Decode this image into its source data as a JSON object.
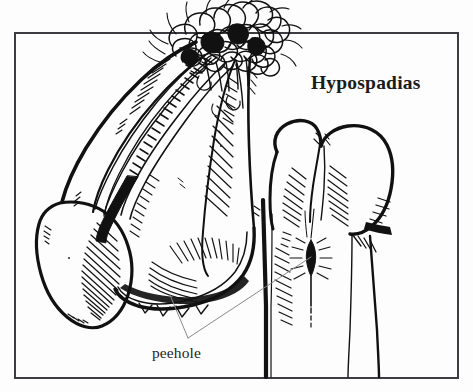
{
  "figure": {
    "domain": "Diagram",
    "kind": "medical-line-illustration",
    "medium": "pen-and-ink black and white drawing",
    "title": "Hypospadias",
    "ghost_text_top": "Hypospadias",
    "background_color": "#fdfdfd",
    "ink_color": "#111111",
    "frame": {
      "present": true,
      "color": "#3c3c42",
      "stroke_width": 2,
      "x": 15,
      "y": 33,
      "width": 443,
      "height": 345
    },
    "callouts": [
      {
        "label": "peehole",
        "label_x": 152,
        "label_y": 344,
        "leader_color": "#8a8a90",
        "leader_width": 1,
        "apex_x": 188,
        "apex_y": 338,
        "targets": [
          {
            "name": "ventral-urethral-opening",
            "x": 170,
            "y": 295
          },
          {
            "name": "glans-slit-opening",
            "x": 311,
            "y": 257
          }
        ]
      }
    ],
    "anatomy_parts": [
      {
        "name": "pubic-hair-mass",
        "description": "dense scribbled curly hair tuft at top, overflowing above frame"
      },
      {
        "name": "penile-shaft",
        "description": "curved shaft angled down-left with parallel hatch shading"
      },
      {
        "name": "shaft-ladder-band",
        "description": "ladder-like banded strip of short cross strokes along shaft turning solid black"
      },
      {
        "name": "scrotum-lobe",
        "description": "rounded scrotal lobe at lower left with diagonal hatching"
      },
      {
        "name": "glans-bilobed",
        "description": "bilobed glans at right with central cleft"
      },
      {
        "name": "urethral-meatus-slit",
        "description": "small dark almond shaped opening with radiating hatch marks"
      },
      {
        "name": "ventral-contour",
        "description": "heavy vertical black contour line descending to lower edge"
      }
    ]
  }
}
